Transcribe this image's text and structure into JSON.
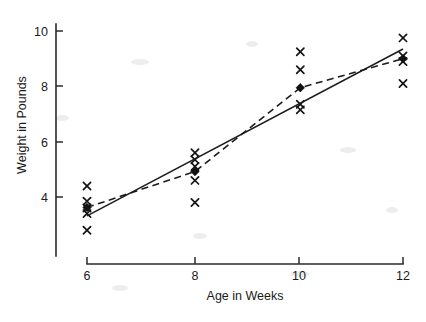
{
  "chart_data": {
    "type": "scatter",
    "title": "",
    "subtitle": "",
    "xlabel": "Age in Weeks",
    "ylabel": "Weight in Pounds",
    "xlim": [
      5.4,
      12.4
    ],
    "ylim": [
      2.4,
      10.6
    ],
    "xticks": [
      6,
      8,
      10,
      12
    ],
    "xtick_labels": [
      "6",
      "8",
      "10",
      "12"
    ],
    "yticks": [
      4,
      6,
      8,
      10
    ],
    "ytick_labels": [
      "4",
      "6",
      "8",
      "10"
    ],
    "grid": false,
    "legend": "none",
    "annotations": [],
    "series": [
      {
        "name": "Observations",
        "type": "scatter",
        "marker": "x",
        "points": [
          {
            "x": 6,
            "y": 4.4
          },
          {
            "x": 6,
            "y": 3.85
          },
          {
            "x": 6,
            "y": 3.6
          },
          {
            "x": 6,
            "y": 3.4
          },
          {
            "x": 6,
            "y": 2.8
          },
          {
            "x": 8.05,
            "y": 5.6
          },
          {
            "x": 8.05,
            "y": 5.35
          },
          {
            "x": 8.05,
            "y": 5.1
          },
          {
            "x": 8.05,
            "y": 4.6
          },
          {
            "x": 8.05,
            "y": 3.8
          },
          {
            "x": 10.05,
            "y": 9.25
          },
          {
            "x": 10.05,
            "y": 8.6
          },
          {
            "x": 10.05,
            "y": 7.35
          },
          {
            "x": 10.05,
            "y": 7.15
          },
          {
            "x": 12,
            "y": 9.75
          },
          {
            "x": 12,
            "y": 9.1
          },
          {
            "x": 12,
            "y": 8.9
          },
          {
            "x": 12,
            "y": 8.1
          }
        ]
      },
      {
        "name": "Group means",
        "type": "line",
        "linestyle": "dashed",
        "marker": "diamond",
        "points": [
          {
            "x": 6,
            "y": 3.62
          },
          {
            "x": 8.05,
            "y": 4.92
          },
          {
            "x": 10.05,
            "y": 7.95
          },
          {
            "x": 12,
            "y": 9.0
          }
        ]
      },
      {
        "name": "Regression line",
        "type": "line",
        "linestyle": "solid",
        "marker": "none",
        "points": [
          {
            "x": 6,
            "y": 3.32
          },
          {
            "x": 12,
            "y": 9.35
          }
        ]
      }
    ]
  },
  "axes": {
    "x_title": "Age in Weeks",
    "y_title": "Weight in Pounds"
  }
}
